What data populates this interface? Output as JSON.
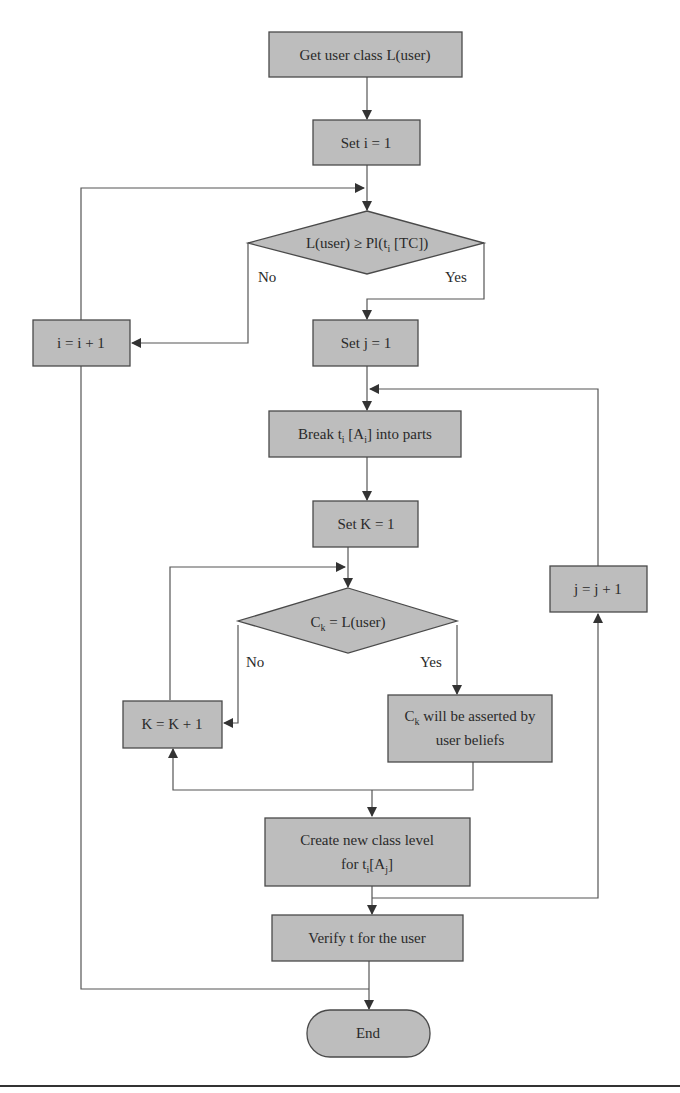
{
  "diagram": {
    "type": "flowchart",
    "colors": {
      "node_fill": "#bdbdbd",
      "node_stroke": "#4a4a4a",
      "edge": "#555555",
      "background": "#ffffff"
    },
    "nodes": {
      "get_class": {
        "shape": "process",
        "label": "Get user class L(user)"
      },
      "set_i": {
        "shape": "process",
        "label": "Set i = 1"
      },
      "decision_level": {
        "shape": "decision",
        "label_main": "L(user) ≥ Pl(t",
        "label_sub": "i",
        "label_tail": " [TC])"
      },
      "inc_i": {
        "shape": "process",
        "label": "i = i + 1"
      },
      "set_j": {
        "shape": "process",
        "label": "Set j = 1"
      },
      "break_parts": {
        "shape": "process",
        "label_a": "Break t",
        "label_sub1": "i",
        "label_b": " [A",
        "label_sub2": "i",
        "label_c": "] into parts"
      },
      "set_k": {
        "shape": "process",
        "label": "Set K = 1"
      },
      "decision_ck": {
        "shape": "decision",
        "label_a": "C",
        "label_sub": "k",
        "label_b": " = L(user)"
      },
      "inc_k": {
        "shape": "process",
        "label": "K = K + 1"
      },
      "assert_ck": {
        "shape": "process",
        "line1_a": "C",
        "line1_sub": "k",
        "line1_b": " will be asserted by",
        "line2": "user beliefs"
      },
      "inc_j": {
        "shape": "process",
        "label": "j = j + 1"
      },
      "create_level": {
        "shape": "process",
        "line1": "Create new class level",
        "line2_a": "for t",
        "line2_sub1": "i",
        "line2_b": "[A",
        "line2_sub2": "j",
        "line2_c": "]"
      },
      "verify": {
        "shape": "process",
        "label": "Verify t for the user"
      },
      "end": {
        "shape": "terminator",
        "label": "End"
      }
    },
    "edge_labels": {
      "d1_no": "No",
      "d1_yes": "Yes",
      "d2_no": "No",
      "d2_yes": "Yes"
    },
    "edges": [
      {
        "from": "get_class",
        "to": "set_i"
      },
      {
        "from": "set_i",
        "to": "decision_level"
      },
      {
        "from": "decision_level",
        "to": "set_j",
        "label": "Yes"
      },
      {
        "from": "decision_level",
        "to": "inc_i",
        "label": "No"
      },
      {
        "from": "inc_i",
        "to": "decision_level"
      },
      {
        "from": "inc_i",
        "to": "end"
      },
      {
        "from": "set_j",
        "to": "break_parts"
      },
      {
        "from": "break_parts",
        "to": "set_k"
      },
      {
        "from": "set_k",
        "to": "decision_ck"
      },
      {
        "from": "decision_ck",
        "to": "assert_ck",
        "label": "Yes"
      },
      {
        "from": "decision_ck",
        "to": "inc_k",
        "label": "No"
      },
      {
        "from": "inc_k",
        "to": "decision_ck"
      },
      {
        "from": "assert_ck",
        "to": "inc_k"
      },
      {
        "from": "assert_ck",
        "to": "create_level"
      },
      {
        "from": "create_level",
        "to": "inc_j"
      },
      {
        "from": "inc_j",
        "to": "break_parts"
      },
      {
        "from": "create_level",
        "to": "verify"
      },
      {
        "from": "verify",
        "to": "end"
      }
    ]
  }
}
